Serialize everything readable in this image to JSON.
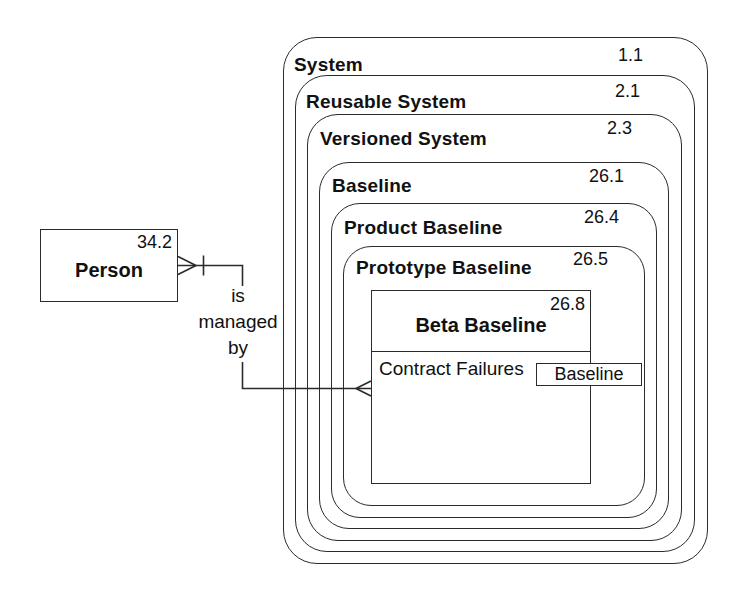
{
  "canvas": {
    "background_color": "#ffffff",
    "line_color": "#2b2b2b",
    "text_color": "#111111"
  },
  "person_entity": {
    "name": "Person",
    "number": "34.2"
  },
  "relationship": {
    "label": "is\nmanaged\nby"
  },
  "nested_containers": [
    {
      "label": "System",
      "number": "1.1"
    },
    {
      "label": "Reusable System",
      "number": "2.1"
    },
    {
      "label": "Versioned System",
      "number": "2.3"
    },
    {
      "label": "Baseline",
      "number": "26.1"
    },
    {
      "label": "Product Baseline",
      "number": "26.4"
    },
    {
      "label": "Prototype Baseline",
      "number": "26.5"
    }
  ],
  "beta_baseline_class": {
    "name": "Beta Baseline",
    "number": "26.8",
    "attribute": "Contract Failures",
    "reference_label": "Baseline"
  }
}
